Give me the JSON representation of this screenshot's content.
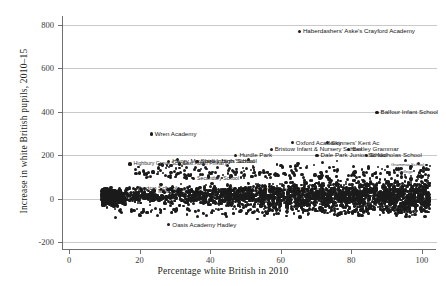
{
  "chart_data": {
    "type": "scatter",
    "title": "",
    "xlabel": "Percentage white British in 2010",
    "ylabel": "Increase in white British pupils, 2010–15",
    "xlim": [
      -2,
      104
    ],
    "ylim": [
      -230,
      840
    ],
    "xticks": [
      0,
      20,
      40,
      60,
      80,
      100
    ],
    "yticks": [
      -200,
      0,
      200,
      400,
      600,
      800
    ],
    "xticklabels": [
      "0",
      "20",
      "40",
      "60",
      "80",
      "100"
    ],
    "yticklabels": [
      "-200",
      "0",
      "200",
      "400",
      "600",
      "800"
    ],
    "grid": "horizontal",
    "legend": "none",
    "marker_color": "#1b1b1b",
    "grid_color": "#c9c9c9",
    "axis_color": "#6f6f6f",
    "labelled_points": [
      {
        "name": "Haberdashers' Aske's Crayford Academy",
        "x": 65,
        "y": 770,
        "cls": "lbl"
      },
      {
        "name": "Balfour Infant School",
        "x": 87,
        "y": 398,
        "cls": "lbl"
      },
      {
        "name": "Wren Academy",
        "x": 23,
        "y": 298,
        "cls": "lbl"
      },
      {
        "name": "Oxford Academy",
        "x": 63,
        "y": 258,
        "cls": "lbl"
      },
      {
        "name": "Skinners' Kent Ac",
        "x": 73,
        "y": 258,
        "cls": "lbl"
      },
      {
        "name": "Bristow Infant & Nursery School",
        "x": 57,
        "y": 227,
        "cls": "lbl"
      },
      {
        "name": "Bexley Grammar",
        "x": 79,
        "y": 227,
        "cls": "lbl"
      },
      {
        "name": "Hurdle Park",
        "x": 47,
        "y": 200,
        "cls": "lbl"
      },
      {
        "name": "Dale Park Junior School",
        "x": 70,
        "y": 200,
        "cls": "lbl"
      },
      {
        "name": "St Nicholas School",
        "x": 84,
        "y": 200,
        "cls": "lbl"
      },
      {
        "name": "Henry Maynard Infants' School",
        "x": 28,
        "y": 172,
        "cls": "lbl"
      },
      {
        "name": "Shirley High School",
        "x": 36,
        "y": 172,
        "cls": "lbl"
      },
      {
        "name": "Highbury Grove School",
        "x": 17,
        "y": 160,
        "cls": "lbl dense"
      },
      {
        "name": "East Acton Primary",
        "x": 31,
        "y": 160,
        "cls": "lbl dense"
      },
      {
        "name": "Buxton School",
        "x": 18,
        "y": 48,
        "cls": "lbl"
      },
      {
        "name": "Morpeth School",
        "x": 24,
        "y": 36,
        "cls": "lbl"
      },
      {
        "name": "City of London Academy (Southwark)",
        "x": 44,
        "y": 44,
        "cls": "lbl"
      },
      {
        "name": "Oasis Academy Hadley",
        "x": 28,
        "y": -118,
        "cls": "lbl"
      },
      {
        "name": "Secondary School",
        "x": 35,
        "y": 92,
        "cls": "lbl dense"
      },
      {
        "name": "Grammar School",
        "x": 90,
        "y": 150,
        "cls": "lbl tiny"
      },
      {
        "name": "College",
        "x": 92,
        "y": 120,
        "cls": "lbl tiny"
      }
    ]
  }
}
